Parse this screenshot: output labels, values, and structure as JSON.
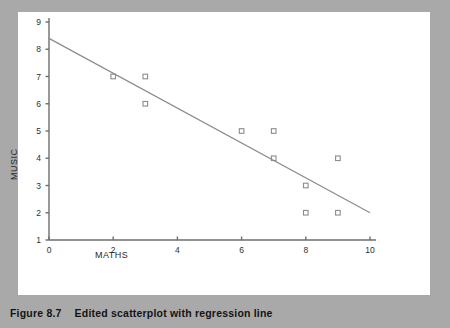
{
  "figure": {
    "caption_number": "Figure 8.7",
    "caption_title": "Edited scatterplot with regression line",
    "border_color": "#a9a9a9",
    "panel_color": "#ffffff"
  },
  "chart_data": {
    "type": "scatter",
    "title": "",
    "xlabel": "MATHS",
    "ylabel": "MUSIC",
    "xlim": [
      0,
      10
    ],
    "ylim": [
      1,
      9
    ],
    "xticks": [
      0,
      2,
      4,
      6,
      8,
      10
    ],
    "xtick_labels": [
      "0",
      "2",
      "4",
      "6",
      "8",
      "10"
    ],
    "yticks": [
      1,
      2,
      3,
      4,
      5,
      6,
      7,
      8,
      9
    ],
    "ytick_labels": [
      "1",
      "2",
      "3",
      "4",
      "5",
      "6",
      "7",
      "8",
      "9"
    ],
    "grid": false,
    "legend": false,
    "marker_style": "open-square",
    "marker_color": "#8c8c8c",
    "line_color": "#8c8c8c",
    "axis_color": "#6e6e6e",
    "points": [
      {
        "x": 2,
        "y": 7
      },
      {
        "x": 3,
        "y": 7
      },
      {
        "x": 3,
        "y": 6
      },
      {
        "x": 6,
        "y": 5
      },
      {
        "x": 7,
        "y": 5
      },
      {
        "x": 7,
        "y": 4
      },
      {
        "x": 9,
        "y": 4
      },
      {
        "x": 8,
        "y": 3
      },
      {
        "x": 8,
        "y": 2
      },
      {
        "x": 9,
        "y": 2
      }
    ],
    "regression_line": {
      "x_start": 0,
      "y_start": 8.4,
      "x_end": 10,
      "y_end": 2.0
    }
  }
}
